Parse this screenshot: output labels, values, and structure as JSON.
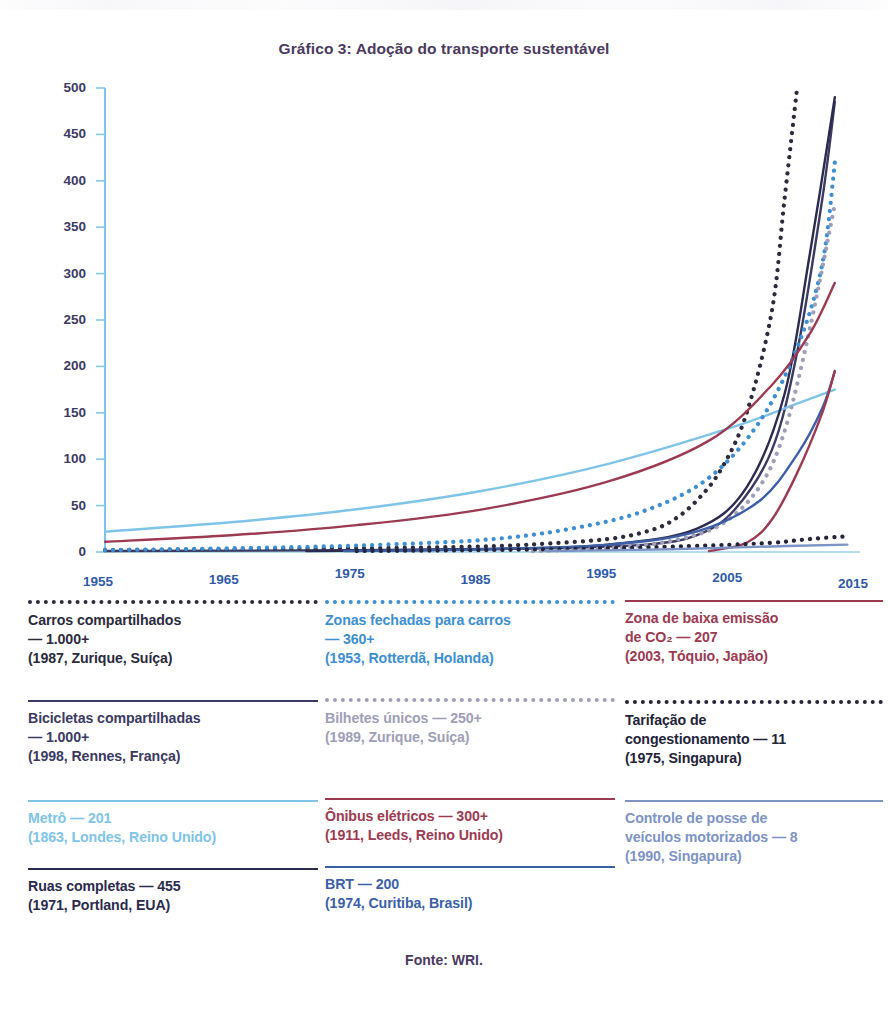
{
  "title": "Gráfico 3: Adoção do transporte sustentável",
  "source": "Fonte: WRI.",
  "axis": {
    "y_ticks": [
      "500",
      "450",
      "400",
      "350",
      "300",
      "250",
      "200",
      "150",
      "100",
      "50",
      "0"
    ],
    "x_ticks": [
      "1955",
      "1965",
      "1975",
      "1985",
      "1995",
      "2005",
      "2015"
    ]
  },
  "legend": {
    "columns": [
      {
        "items": [
          {
            "name": "carros-compartilhados",
            "label": "Carros compartilhados\n— 1.000+\n(1987, Zurique, Suíça)",
            "style": "dotted",
            "color": "#2b2b3d"
          },
          {
            "name": "bicicletas-compartilhadas",
            "label": "Bicicletas compartilhadas\n— 1.000+\n(1998, Rennes, França)",
            "style": "solid",
            "color": "#3a3a63"
          },
          {
            "name": "metro",
            "label": "Metrô — 201\n(1863, Londes, Reino Unido)",
            "style": "solid",
            "color": "#7ec4e8"
          },
          {
            "name": "ruas-completas",
            "label": "Ruas completas — 455\n(1971, Portland, EUA)",
            "style": "solid",
            "color": "#2b2b4f"
          }
        ]
      },
      {
        "items": [
          {
            "name": "zonas-fechadas-para-carros",
            "label": "Zonas fechadas para carros\n— 360+\n(1953, Rotterdã, Holanda)",
            "style": "dotted",
            "color": "#3d8fd0"
          },
          {
            "name": "bilhetes-unicos",
            "label": "Bilhetes únicos — 250+\n(1989, Zurique, Suíça)",
            "style": "dotted",
            "color": "#9e9eb8"
          },
          {
            "name": "onibus-eletricos",
            "label": "Ônibus elétricos — 300+\n(1911, Leeds, Reino Unido)",
            "style": "solid",
            "color": "#9c3a52"
          },
          {
            "name": "brt",
            "label": "BRT — 200\n(1974, Curitiba, Brasil)",
            "style": "solid",
            "color": "#3c5fa8"
          }
        ]
      },
      {
        "items": [
          {
            "name": "zona-de-baixa-emissao-de-co2",
            "label": "Zona de baixa emissão\nde CO₂ — 207\n(2003, Tóquio, Japão)",
            "style": "solid",
            "color": "#9c3a52"
          },
          {
            "name": "tarifacao-de-congestionamento",
            "label": "Tarifação de\ncongestionamento — 11\n(1975, Singapura)",
            "style": "dotted",
            "color": "#23233a"
          },
          {
            "name": "controle-de-posse-de-veiculos",
            "label": "Controle de posse de\nveículos motorizados — 8\n(1990, Singapura)",
            "style": "solid",
            "color": "#7d93c6"
          }
        ]
      }
    ]
  },
  "chart_data": {
    "type": "line",
    "title": "Gráfico 3: Adoção do transporte sustentável",
    "xlabel": "",
    "ylabel": "",
    "xlim": [
      1955,
      2015
    ],
    "ylim": [
      0,
      500
    ],
    "grid": false,
    "legend_position": "below",
    "x_ticks": [
      1955,
      1965,
      1975,
      1985,
      1995,
      2005,
      2015
    ],
    "y_ticks": [
      0,
      50,
      100,
      150,
      200,
      250,
      300,
      350,
      400,
      450,
      500
    ],
    "series": [
      {
        "name": "Carros compartilhados",
        "final_value": "1.000+",
        "first_city": "1987, Zurique, Suíça",
        "style": "dotted",
        "color": "#2b2b3d",
        "x": [
          1955,
          1965,
          1975,
          1985,
          1990,
          1995,
          1998,
          2000,
          2002,
          2004,
          2006,
          2008,
          2009,
          2010
        ],
        "y": [
          2,
          3,
          4,
          6,
          9,
          14,
          22,
          33,
          55,
          90,
          150,
          260,
          380,
          500
        ]
      },
      {
        "name": "Bicicletas compartilhadas",
        "final_value": "1.000+",
        "first_city": "1998, Rennes, França",
        "style": "solid",
        "color": "#3a3a63",
        "x": [
          1955,
          1975,
          1990,
          1998,
          2002,
          2005,
          2008,
          2010,
          2012,
          2013
        ],
        "y": [
          1,
          2,
          4,
          8,
          18,
          45,
          110,
          215,
          380,
          485
        ]
      },
      {
        "name": "Metrô",
        "final_value": 201,
        "first_city": "1863, Londes, Reino Unido",
        "style": "solid",
        "color": "#7ec4e8",
        "x": [
          1955,
          1965,
          1975,
          1985,
          1995,
          2005,
          2010,
          2013
        ],
        "y": [
          22,
          32,
          46,
          66,
          95,
          135,
          160,
          175
        ]
      },
      {
        "name": "Ruas completas",
        "final_value": 455,
        "first_city": "1971, Portland, EUA",
        "style": "solid",
        "color": "#2b2b4f",
        "x": [
          1971,
          1985,
          1995,
          2002,
          2006,
          2009,
          2011,
          2013
        ],
        "y": [
          1,
          3,
          8,
          25,
          70,
          170,
          320,
          490
        ]
      },
      {
        "name": "Zonas fechadas para carros",
        "final_value": "360+",
        "first_city": "1953, Rotterdã, Holanda",
        "style": "dotted",
        "color": "#3d8fd0",
        "x": [
          1955,
          1965,
          1975,
          1985,
          1992,
          1998,
          2003,
          2007,
          2010,
          2012,
          2013
        ],
        "y": [
          2,
          4,
          7,
          13,
          25,
          45,
          80,
          140,
          220,
          310,
          420
        ]
      },
      {
        "name": "Bilhetes únicos",
        "final_value": "250+",
        "first_city": "1989, Zurique, Suíça",
        "style": "dotted",
        "color": "#9e9eb8",
        "x": [
          1989,
          1995,
          2000,
          2004,
          2007,
          2009,
          2011,
          2013
        ],
        "y": [
          1,
          4,
          12,
          30,
          70,
          130,
          240,
          375
        ]
      },
      {
        "name": "Ônibus elétricos",
        "final_value": "300+",
        "first_city": "1911, Leeds, Reino Unido",
        "style": "solid",
        "color": "#9c3a52",
        "x": [
          1955,
          1965,
          1975,
          1985,
          1995,
          2003,
          2008,
          2011,
          2013
        ],
        "y": [
          11,
          18,
          29,
          46,
          76,
          120,
          180,
          235,
          290
        ]
      },
      {
        "name": "BRT",
        "final_value": 200,
        "first_city": "1974, Curitiba, Brasil",
        "style": "solid",
        "color": "#3c5fa8",
        "x": [
          1974,
          1985,
          1995,
          2002,
          2007,
          2010,
          2012,
          2013
        ],
        "y": [
          1,
          3,
          8,
          22,
          55,
          105,
          155,
          195
        ]
      },
      {
        "name": "Zona de baixa emissão de CO₂",
        "final_value": 207,
        "first_city": "2003, Tóquio, Japão",
        "style": "solid",
        "color": "#9c3a52",
        "x": [
          2003,
          2006,
          2008,
          2010,
          2012,
          2013
        ],
        "y": [
          1,
          10,
          35,
          85,
          150,
          195
        ]
      },
      {
        "name": "Tarifação de congestionamento",
        "final_value": 11,
        "first_city": "1975, Singapura",
        "style": "dotted",
        "color": "#23233a",
        "x": [
          1975,
          1985,
          1995,
          2003,
          2008,
          2011,
          2014
        ],
        "y": [
          1,
          2,
          4,
          7,
          10,
          14,
          17
        ]
      },
      {
        "name": "Controle de posse de veículos motorizados",
        "final_value": 8,
        "first_city": "1990, Singapura",
        "style": "solid",
        "color": "#7d93c6",
        "x": [
          1990,
          2000,
          2008,
          2014
        ],
        "y": [
          1,
          3,
          6,
          8
        ]
      }
    ]
  }
}
